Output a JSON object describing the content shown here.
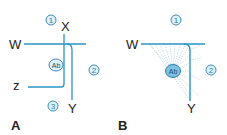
{
  "figure": {
    "panels": [
      {
        "id": "A",
        "label": "A",
        "axis_labels": {
          "w": "W",
          "x": "X",
          "y": "Y",
          "z": "z"
        },
        "markers": {
          "one": "1",
          "two": "2",
          "three": "3",
          "ab": "Ab"
        }
      },
      {
        "id": "B",
        "label": "B",
        "axis_labels": {
          "w": "W",
          "y": "Y"
        },
        "markers": {
          "one": "1",
          "two": "2",
          "ab": "Ab"
        }
      }
    ],
    "colors": {
      "line": "#2a95c4",
      "marker_stroke": "#2a7fb0",
      "marker_fill": "#dff0f8",
      "ab_fill": "#7fc2df",
      "fan": "#9cc6da",
      "text": "#222222"
    }
  }
}
